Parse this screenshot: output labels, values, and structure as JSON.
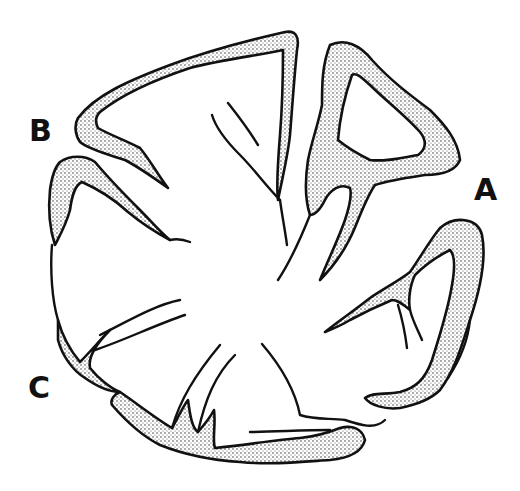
{
  "figure": {
    "type": "line-drawing",
    "colors": {
      "ink": "#111111",
      "background": "#ffffff",
      "stipple": "#333333"
    }
  },
  "labels": {
    "a": "A",
    "b": "B",
    "c": "C"
  }
}
